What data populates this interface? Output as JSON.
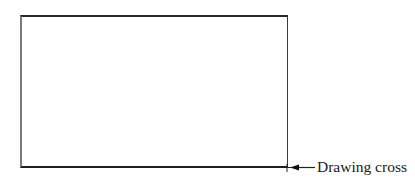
{
  "diagram": {
    "rectangle": {
      "label": "",
      "stroke_color": "#222222"
    },
    "annotation": {
      "label": "Drawing cross",
      "arrow_direction": "left",
      "points_to": "bottom-right corner of rectangle"
    },
    "marker": {
      "type": "cross",
      "position": "bottom-right corner"
    }
  }
}
